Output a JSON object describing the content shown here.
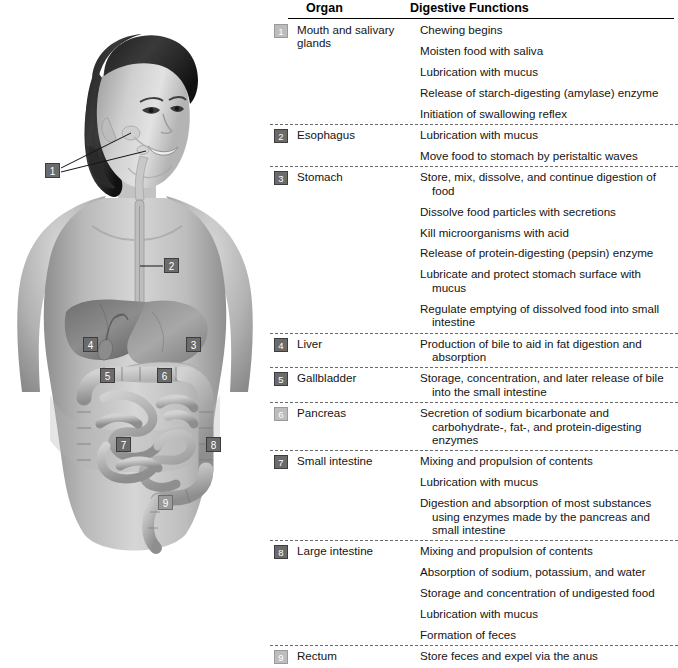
{
  "figure": {
    "alt_description": "Anatomical illustration of a young woman's head and torso showing the digestive system organs with numbered callouts",
    "callouts": [
      {
        "number": "1",
        "organ": "Mouth and salivary glands",
        "x": 45,
        "y": 163,
        "style": "dark"
      },
      {
        "number": "2",
        "organ": "Esophagus",
        "x": 164,
        "y": 258,
        "style": "dark"
      },
      {
        "number": "3",
        "organ": "Stomach",
        "x": 186,
        "y": 337,
        "style": "dark"
      },
      {
        "number": "4",
        "organ": "Liver",
        "x": 83,
        "y": 337,
        "style": "dark"
      },
      {
        "number": "5",
        "organ": "Gallbladder",
        "x": 100,
        "y": 368,
        "style": "dark"
      },
      {
        "number": "6",
        "organ": "Pancreas",
        "x": 157,
        "y": 368,
        "style": "dark"
      },
      {
        "number": "7",
        "organ": "Small intestine",
        "x": 116,
        "y": 437,
        "style": "dark"
      },
      {
        "number": "8",
        "organ": "Large intestine",
        "x": 206,
        "y": 437,
        "style": "dark"
      },
      {
        "number": "9",
        "organ": "Rectum",
        "x": 158,
        "y": 495,
        "style": "dark"
      }
    ]
  },
  "table": {
    "headers": {
      "organ": "Organ",
      "functions": "Digestive Functions"
    },
    "rows": [
      {
        "number": "1",
        "organ": "Mouth and salivary glands",
        "badge_style": "faint",
        "functions": [
          "Chewing begins",
          "Moisten food with saliva",
          "Lubrication with mucus",
          "Release of starch-digesting (amylase) enzyme",
          "Initiation of swallowing reflex"
        ]
      },
      {
        "number": "2",
        "organ": "Esophagus",
        "badge_style": "dark",
        "functions": [
          "Lubrication with mucus",
          "Move food to stomach by peristaltic waves"
        ]
      },
      {
        "number": "3",
        "organ": "Stomach",
        "badge_style": "dark",
        "functions": [
          "Store, mix, dissolve, and continue digestion of food",
          "Dissolve food particles with secretions",
          "Kill microorganisms with acid",
          "Release of protein-digesting (pepsin) enzyme",
          "Lubricate and protect stomach surface with mucus",
          "Regulate emptying of dissolved food into small intestine"
        ]
      },
      {
        "number": "4",
        "organ": "Liver",
        "badge_style": "dark",
        "functions": [
          "Production of bile to aid in fat digestion and absorption"
        ]
      },
      {
        "number": "5",
        "organ": "Gallbladder",
        "badge_style": "dark",
        "functions": [
          "Storage, concentration, and later release of bile into the small intestine"
        ]
      },
      {
        "number": "6",
        "organ": "Pancreas",
        "badge_style": "faint",
        "functions": [
          "Secretion of sodium bicarbonate and carbohydrate-, fat-, and protein-digesting enzymes"
        ]
      },
      {
        "number": "7",
        "organ": "Small intestine",
        "badge_style": "dark",
        "functions": [
          "Mixing and propulsion of contents",
          "Lubrication with mucus",
          "Digestion and absorption of most substances using enzymes made by the pancreas and small intestine"
        ]
      },
      {
        "number": "8",
        "organ": "Large intestine",
        "badge_style": "dark",
        "functions": [
          "Mixing and propulsion of contents",
          "Absorption of sodium, potassium, and water",
          "Storage and concentration of undigested food",
          "Lubrication with mucus",
          "Formation of feces"
        ]
      },
      {
        "number": "9",
        "organ": "Rectum",
        "badge_style": "faint",
        "functions": [
          "Store feces and expel via the anus"
        ]
      }
    ]
  },
  "colors": {
    "badge_dark": "#6b6b6b",
    "badge_faint": "#bdbdbd",
    "rule": "#000000",
    "divider": "#6a6a6a",
    "text": "#141414",
    "background": "#ffffff"
  }
}
